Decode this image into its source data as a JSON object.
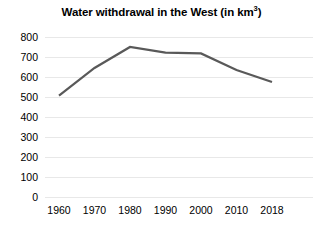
{
  "chart_data": {
    "type": "line",
    "title": "Water withdrawal in the West (in km",
    "title_sup": "3",
    "title_suffix": ")",
    "title_full": "Water withdrawal in the West (in km³)",
    "xlabel": "",
    "ylabel": "",
    "categories": [
      "1960",
      "1970",
      "1980",
      "1990",
      "2000",
      "2010",
      "2018"
    ],
    "x": [
      1960,
      1970,
      1980,
      1990,
      2000,
      2010,
      2018
    ],
    "values": [
      507,
      645,
      750,
      722,
      718,
      635,
      575
    ],
    "series": [
      {
        "name": "Water withdrawal",
        "values": [
          507,
          645,
          750,
          722,
          718,
          635,
          575
        ],
        "color": "#595959",
        "line_width": 2.2
      }
    ],
    "ylim": [
      0,
      800
    ],
    "y_ticks": [
      800,
      700,
      600,
      500,
      400,
      300,
      200,
      100,
      0
    ],
    "y_tick_labels": [
      "800",
      "700",
      "600",
      "500",
      "400",
      "300",
      "200",
      "100",
      "0"
    ],
    "x_tick_labels": [
      "1960",
      "1970",
      "1980",
      "1990",
      "2000",
      "2010",
      "2018"
    ],
    "grid": true,
    "grid_axis": "y",
    "grid_color": "#e8e8e8",
    "legend": false,
    "legend_position": "none",
    "background": "#ffffff",
    "text_color": "#000000"
  }
}
